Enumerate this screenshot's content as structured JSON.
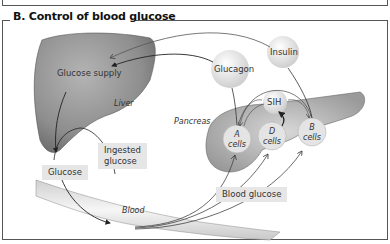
{
  "title": "B. Control of blood glucose",
  "labels": {
    "glucose_supply": "Glucose supply",
    "liver": "Liver",
    "glucagon": "Glucagon",
    "insulin": "Insulin",
    "pancreas": "Pancreas",
    "sih": "SIH",
    "ingested_glucose_line1": "Ingested",
    "ingested_glucose_line2": "glucose",
    "glucose": "Glucose",
    "blood": "Blood",
    "blood_glucose": "Blood glucose",
    "a_cells_letter": "A",
    "a_cells_word": "cells",
    "d_cells_letter": "D",
    "d_cells_word": "cells",
    "b_cells_letter": "B",
    "b_cells_word": "cells"
  },
  "colors": {
    "liver": "#8a8a8a",
    "hormone_sphere": "#e2e2e2",
    "box_fill": "#e6e6e6",
    "frame": "#555555"
  }
}
